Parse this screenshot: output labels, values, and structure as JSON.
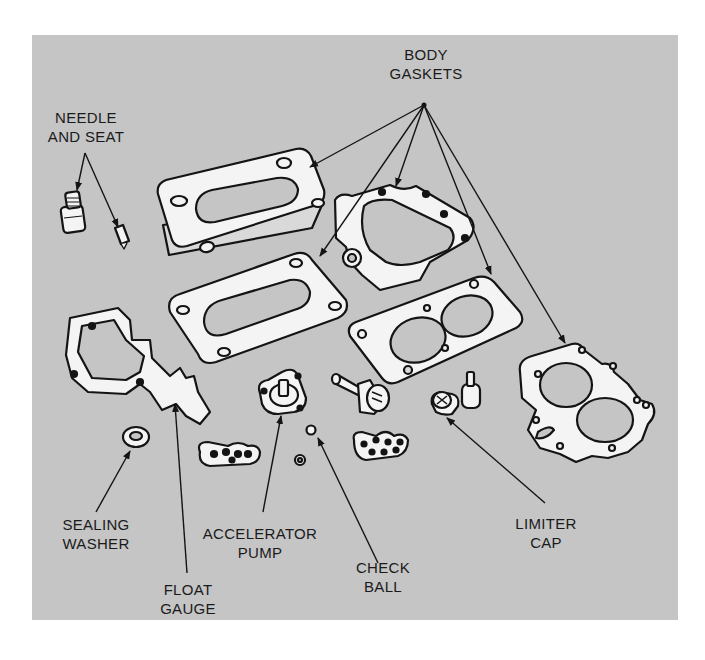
{
  "figure": {
    "background": "#c5c5c5",
    "part_fill": "#f4f4f4",
    "outline": "#141414"
  },
  "labels": {
    "body_gaskets": {
      "line1": "BODY",
      "line2": "GASKETS"
    },
    "needle_and_seat": {
      "line1": "NEEDLE",
      "line2": "AND SEAT"
    },
    "sealing_washer": {
      "line1": "SEALING",
      "line2": "WASHER"
    },
    "float_gauge": {
      "line1": "FLOAT",
      "line2": "GAUGE"
    },
    "accelerator_pump": {
      "line1": "ACCELERATOR",
      "line2": "PUMP"
    },
    "check_ball": {
      "line1": "CHECK",
      "line2": "BALL"
    },
    "limiter_cap": {
      "line1": "LIMITER",
      "line2": "CAP"
    }
  }
}
